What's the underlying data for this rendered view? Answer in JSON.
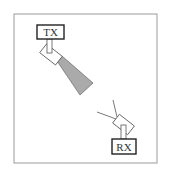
{
  "diagram": {
    "transmitter": {
      "label": "TX"
    },
    "receiver": {
      "label": "RX"
    },
    "colors": {
      "frame": "#9a9a9a",
      "stroke": "#3a3a3a",
      "beam_fill": "#aaaaaa",
      "background": "#ffffff"
    }
  }
}
